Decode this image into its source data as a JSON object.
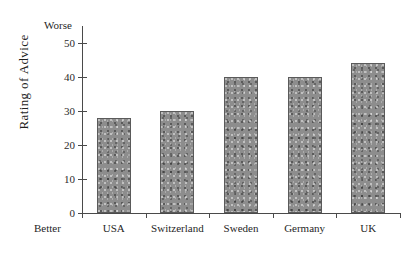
{
  "chart_data": {
    "type": "bar",
    "title": "",
    "subtitle": "",
    "xlabel": "",
    "ylabel": "Rating of Advice",
    "categories": [
      "USA",
      "Switzerland",
      "Sweden",
      "Germany",
      "UK"
    ],
    "values": [
      28,
      30,
      40,
      40,
      44
    ],
    "series": [
      {
        "name": "Rating of Advice",
        "values": [
          28,
          30,
          40,
          40,
          44
        ]
      }
    ],
    "ylim": [
      0,
      55
    ],
    "yticks": [
      0,
      10,
      20,
      30,
      40,
      50
    ],
    "ytick_labels": [
      "0",
      "10",
      "20",
      "30",
      "40",
      "50"
    ],
    "grid": false,
    "legend": false,
    "legend_position": "none",
    "bar_color": "#8d8d8d",
    "bar_edge_color": "#5a5a5a",
    "axis_color": "#4a4a4a",
    "background_color": "#ffffff",
    "annotations": {
      "axis_top_note": "Worse",
      "axis_bottom_note": "Better"
    }
  },
  "axis": {
    "y_title": "Rating of Advice",
    "scale_high_note": "Worse",
    "scale_low_note": "Better"
  },
  "caption": {
    "text": ""
  }
}
